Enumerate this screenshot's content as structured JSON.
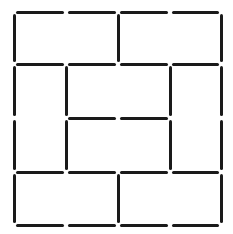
{
  "diagram": {
    "type": "matchstick-puzzle",
    "stick_color": "#1a1a1a",
    "background": "#ffffff",
    "grid": {
      "x": [
        14,
        66,
        118,
        170,
        221
      ],
      "y": [
        12,
        64,
        118,
        172,
        225
      ]
    },
    "sticks": [
      {
        "o": "h",
        "r": 0,
        "c": 0
      },
      {
        "o": "h",
        "r": 0,
        "c": 1
      },
      {
        "o": "h",
        "r": 0,
        "c": 2
      },
      {
        "o": "h",
        "r": 0,
        "c": 3
      },
      {
        "o": "h",
        "r": 1,
        "c": 0
      },
      {
        "o": "h",
        "r": 1,
        "c": 1
      },
      {
        "o": "h",
        "r": 1,
        "c": 2
      },
      {
        "o": "h",
        "r": 1,
        "c": 3
      },
      {
        "o": "h",
        "r": 2,
        "c": 1
      },
      {
        "o": "h",
        "r": 2,
        "c": 2
      },
      {
        "o": "h",
        "r": 3,
        "c": 0
      },
      {
        "o": "h",
        "r": 3,
        "c": 1
      },
      {
        "o": "h",
        "r": 3,
        "c": 2
      },
      {
        "o": "h",
        "r": 3,
        "c": 3
      },
      {
        "o": "h",
        "r": 4,
        "c": 0
      },
      {
        "o": "h",
        "r": 4,
        "c": 1
      },
      {
        "o": "h",
        "r": 4,
        "c": 2
      },
      {
        "o": "h",
        "r": 4,
        "c": 3
      },
      {
        "o": "v",
        "r": 0,
        "c": 0
      },
      {
        "o": "v",
        "r": 0,
        "c": 2
      },
      {
        "o": "v",
        "r": 0,
        "c": 4
      },
      {
        "o": "v",
        "r": 1,
        "c": 0
      },
      {
        "o": "v",
        "r": 1,
        "c": 1
      },
      {
        "o": "v",
        "r": 1,
        "c": 3
      },
      {
        "o": "v",
        "r": 1,
        "c": 4
      },
      {
        "o": "v",
        "r": 2,
        "c": 0
      },
      {
        "o": "v",
        "r": 2,
        "c": 1
      },
      {
        "o": "v",
        "r": 2,
        "c": 3
      },
      {
        "o": "v",
        "r": 2,
        "c": 4
      },
      {
        "o": "v",
        "r": 3,
        "c": 0
      },
      {
        "o": "v",
        "r": 3,
        "c": 2
      },
      {
        "o": "v",
        "r": 3,
        "c": 4
      }
    ],
    "stick_count": 32
  }
}
